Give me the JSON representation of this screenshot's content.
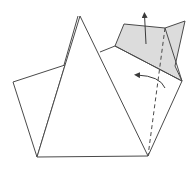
{
  "diagram": {
    "type": "origami-fold-step",
    "colors": {
      "line": "#4a4a4a",
      "shaded_flap": "#dcdcdc",
      "background": "#ffffff"
    },
    "shapes": {
      "left_flap": [
        [
          13,
          82
        ],
        [
          65,
          65
        ],
        [
          37,
          157
        ]
      ],
      "main_triangle": [
        [
          37,
          157
        ],
        [
          80,
          16
        ],
        [
          148,
          156
        ]
      ],
      "main_triangle_back_edge": [
        [
          65,
          65
        ],
        [
          78,
          16
        ]
      ],
      "right_body": [
        [
          100,
          52
        ],
        [
          115,
          46
        ],
        [
          182,
          81
        ],
        [
          148,
          156
        ]
      ],
      "shaded_flap": [
        [
          115,
          46
        ],
        [
          124,
          24
        ],
        [
          165,
          28
        ],
        [
          185,
          21
        ],
        [
          175,
          66
        ],
        [
          182,
          81
        ]
      ],
      "shaded_inner_edge": [
        [
          165,
          28
        ],
        [
          182,
          81
        ]
      ]
    },
    "fold_lines": {
      "valley_fold_dashed": [
        [
          165,
          28
        ],
        [
          148,
          156
        ]
      ]
    },
    "arrows": {
      "lift_arrow": {
        "from": [
          146,
          44
        ],
        "to": [
          144,
          13
        ],
        "meaning": "lift flap up"
      },
      "fold_arrow": {
        "from": [
          165,
          88
        ],
        "to": [
          135,
          75
        ],
        "meaning": "fold over to left"
      }
    }
  }
}
